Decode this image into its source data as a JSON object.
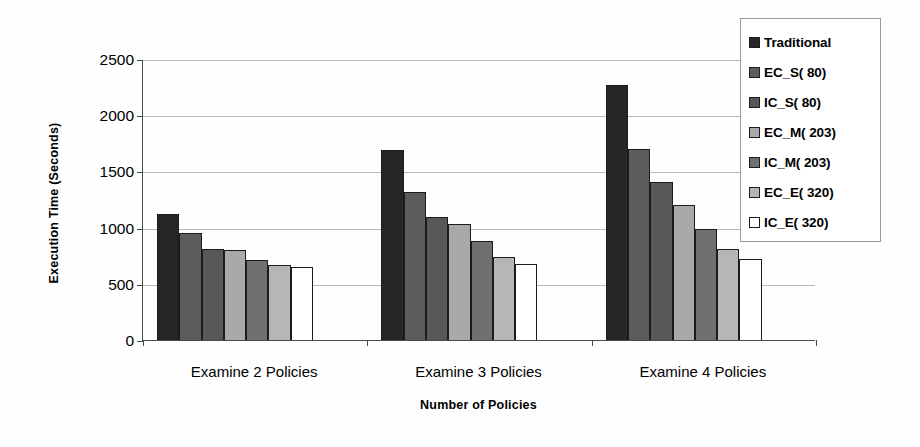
{
  "chart_data": {
    "type": "bar",
    "title": "",
    "xlabel": "Number of Policies",
    "ylabel": "Execution Time (Seconds)",
    "categories": [
      "Examine 2 Policies",
      "Examine 3 Policies",
      "Examine 4 Policies"
    ],
    "ylim": [
      0,
      2500
    ],
    "yticks": [
      0,
      500,
      1000,
      1500,
      2000,
      2500
    ],
    "ytick_labels": [
      "0",
      "500",
      "1000",
      "1500",
      "2000",
      "2500"
    ],
    "grid": true,
    "legend_position": "top-right",
    "series": [
      {
        "name": "Traditional",
        "color": "#262626",
        "values": [
          1120,
          1690,
          2270
        ]
      },
      {
        "name": "EC_S( 80)",
        "color": "#5c5c5c",
        "values": [
          950,
          1320,
          1700
        ]
      },
      {
        "name": "IC_S( 80)",
        "color": "#585858",
        "values": [
          810,
          1090,
          1410
        ]
      },
      {
        "name": "EC_M( 203)",
        "color": "#a9a9a9",
        "values": [
          800,
          1030,
          1200
        ]
      },
      {
        "name": "IC_M( 203)",
        "color": "#6f6f6f",
        "values": [
          715,
          880,
          990
        ]
      },
      {
        "name": "EC_E( 320)",
        "color": "#b6b6b6",
        "values": [
          670,
          740,
          810
        ]
      },
      {
        "name": "IC_E( 320)",
        "color": "#ffffff",
        "values": [
          650,
          680,
          725
        ]
      }
    ]
  },
  "legend": {
    "items": [
      {
        "label": "Traditional"
      },
      {
        "label": "EC_S( 80)"
      },
      {
        "label": "IC_S( 80)"
      },
      {
        "label": "EC_M( 203)"
      },
      {
        "label": "IC_M( 203)"
      },
      {
        "label": "EC_E( 320)"
      },
      {
        "label": "IC_E( 320)"
      }
    ]
  },
  "axes": {
    "y_title": "Execution Time (Seconds)",
    "x_title": "Number of Policies"
  }
}
